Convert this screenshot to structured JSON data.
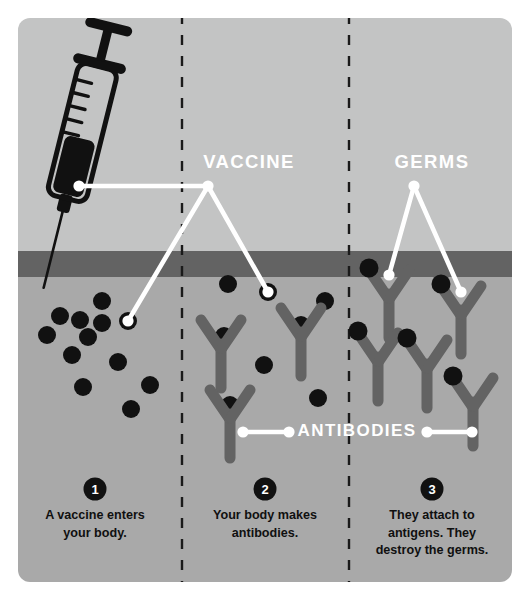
{
  "colors": {
    "page_background": "#ffffff",
    "panel_upper": "#c3c4c4",
    "panel_lower": "#a9a9a9",
    "skin_bar": "#636363",
    "germ": "#111111",
    "antibody": "#636363",
    "label_text": "#ffffff",
    "caption_text": "#101010",
    "badge_fill": "#111111",
    "leader_line": "#ffffff",
    "divider": "#1a1a1a",
    "syringe_outline": "#111111",
    "syringe_fluid": "#111111"
  },
  "panel": {
    "x": 18,
    "y": 18,
    "width": 494,
    "height": 564,
    "radius": 12,
    "skin_bar_y": 251,
    "skin_bar_height": 26
  },
  "dividers": [
    {
      "name": "divider-1-2",
      "x": 182
    },
    {
      "name": "divider-2-3",
      "x": 349
    }
  ],
  "labels": [
    {
      "id": "vaccine",
      "text": "VACCINE",
      "x": 249,
      "y": 168
    },
    {
      "id": "germs",
      "text": "GERMS",
      "x": 432,
      "y": 168
    },
    {
      "id": "antibodies",
      "text": "ANTIBODIES",
      "x": 357,
      "y": 436
    }
  ],
  "steps": [
    {
      "number": "1",
      "badge_x": 95,
      "badge_y": 489,
      "lines": [
        "A vaccine enters",
        "your body."
      ],
      "text_x": 95,
      "text_y": 519
    },
    {
      "number": "2",
      "badge_x": 265,
      "badge_y": 489,
      "lines": [
        "Your body makes",
        "antibodies."
      ],
      "text_x": 265,
      "text_y": 519
    },
    {
      "number": "3",
      "badge_x": 432,
      "badge_y": 489,
      "lines": [
        "They attach to",
        "antigens. They",
        "destroy the germs."
      ],
      "text_x": 432,
      "text_y": 519
    }
  ],
  "syringe": {
    "name": "syringe",
    "rotation_deg": 14,
    "pivot_x": 78,
    "pivot_y": 150,
    "graduation_marks": 5
  },
  "leader_lines": [
    {
      "id": "vaccine-to-syringe",
      "points": [
        [
          79,
          186
        ],
        [
          208,
          186
        ]
      ],
      "dots": [
        [
          79,
          186
        ]
      ]
    },
    {
      "id": "vaccine-node-to-germ-left",
      "points": [
        [
          208,
          186
        ],
        [
          128,
          321
        ]
      ],
      "dots": [
        [
          208,
          186
        ],
        [
          128,
          321
        ]
      ]
    },
    {
      "id": "vaccine-node-to-germ-mid",
      "points": [
        [
          208,
          186
        ],
        [
          268,
          292
        ]
      ],
      "dots": [
        [
          268,
          292
        ]
      ]
    },
    {
      "id": "germs-to-antibody-left",
      "points": [
        [
          414,
          186
        ],
        [
          389,
          275
        ]
      ],
      "dots": [
        [
          414,
          186
        ],
        [
          389,
          275
        ]
      ]
    },
    {
      "id": "germs-to-antibody-right",
      "points": [
        [
          414,
          186
        ],
        [
          461,
          292
        ]
      ],
      "dots": [
        [
          461,
          292
        ]
      ]
    },
    {
      "id": "antibodies-left-connector",
      "points": [
        [
          243,
          432
        ],
        [
          289,
          432
        ]
      ],
      "dots": [
        [
          243,
          432
        ],
        [
          289,
          432
        ]
      ]
    },
    {
      "id": "antibodies-right-connector",
      "points": [
        [
          427,
          432
        ],
        [
          472,
          432
        ]
      ],
      "dots": [
        [
          427,
          432
        ],
        [
          472,
          432
        ]
      ]
    }
  ],
  "germs_panel1": [
    {
      "x": 102,
      "y": 301,
      "r": 9
    },
    {
      "x": 60,
      "y": 316,
      "r": 9
    },
    {
      "x": 80,
      "y": 320,
      "r": 9
    },
    {
      "x": 102,
      "y": 323,
      "r": 9
    },
    {
      "x": 128,
      "y": 321,
      "r": 9
    },
    {
      "x": 47,
      "y": 335,
      "r": 9
    },
    {
      "x": 88,
      "y": 337,
      "r": 9
    },
    {
      "x": 72,
      "y": 355,
      "r": 9
    },
    {
      "x": 118,
      "y": 362,
      "r": 9
    },
    {
      "x": 83,
      "y": 387,
      "r": 9
    },
    {
      "x": 150,
      "y": 385,
      "r": 9
    },
    {
      "x": 131,
      "y": 409,
      "r": 9
    }
  ],
  "germs_panel2": [
    {
      "x": 228,
      "y": 284,
      "r": 9
    },
    {
      "x": 268,
      "y": 292,
      "r": 9
    },
    {
      "x": 325,
      "y": 301,
      "r": 9
    },
    {
      "x": 301,
      "y": 325,
      "r": 9
    },
    {
      "x": 224,
      "y": 336,
      "r": 9
    },
    {
      "x": 264,
      "y": 365,
      "r": 9
    },
    {
      "x": 318,
      "y": 398,
      "r": 9
    },
    {
      "x": 230,
      "y": 405,
      "r": 9
    }
  ],
  "antibodies_panel2": [
    {
      "x": 221,
      "y": 342,
      "germ": false
    },
    {
      "x": 301,
      "y": 330,
      "germ": false
    },
    {
      "x": 230,
      "y": 412,
      "germ": false
    }
  ],
  "antibodies_panel3": [
    {
      "x": 389,
      "y": 292,
      "germ": true
    },
    {
      "x": 461,
      "y": 308,
      "germ": true
    },
    {
      "x": 378,
      "y": 355,
      "germ": true
    },
    {
      "x": 427,
      "y": 362,
      "germ": true
    },
    {
      "x": 473,
      "y": 400,
      "germ": true
    }
  ]
}
